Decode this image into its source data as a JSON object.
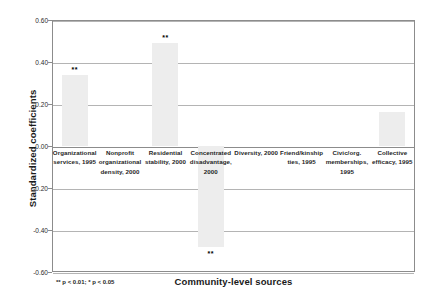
{
  "chart_data": {
    "type": "bar",
    "title": "",
    "xlabel": "Community-level sources",
    "ylabel": "Standardized coefficients",
    "ylim": [
      -0.6,
      0.6
    ],
    "ytick_labels": [
      "0.60",
      "0.40",
      "0.20",
      "0.00",
      "-0.20",
      "-0.40",
      "-0.60"
    ],
    "ytick_values": [
      0.6,
      0.4,
      0.2,
      0.0,
      -0.2,
      -0.4,
      -0.6
    ],
    "grid": true,
    "legend": "none",
    "bar_color": "#ededed",
    "categories": [
      "Organizational services, 1995",
      "Nonprofit organizational density, 2000",
      "Residential stability, 2000",
      "Concentrated disadvantage, 2000",
      "Diversity, 2000",
      "Friend/kinship ties, 1995",
      "Civic/org. memberships, 1995",
      "Collective efficacy, 1995"
    ],
    "values": [
      0.34,
      0.0,
      0.49,
      -0.48,
      0.0,
      0.0,
      0.0,
      0.16
    ],
    "annotations": [
      "**",
      "",
      "**",
      "**",
      "",
      "",
      "",
      ""
    ],
    "footnote": "** p < 0.01; * p < 0.05"
  }
}
